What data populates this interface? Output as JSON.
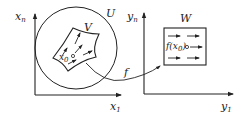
{
  "diagram": {
    "left_space": {
      "axis_vertical_label": "x",
      "axis_vertical_sub": "n",
      "axis_horizontal_label": "x",
      "axis_horizontal_sub": "1",
      "outer_region_label": "U",
      "inner_region_label": "V",
      "point_label": "x",
      "point_sub": "0"
    },
    "mapping": {
      "label": "f"
    },
    "right_space": {
      "axis_vertical_label": "y",
      "axis_vertical_sub": "n",
      "axis_horizontal_label": "y",
      "axis_horizontal_sub": "1",
      "region_label": "W",
      "point_label": "f(x",
      "point_sub": "0",
      "point_close": ")"
    },
    "colors": {
      "ink": "#222222",
      "background": "#ffffff"
    }
  }
}
